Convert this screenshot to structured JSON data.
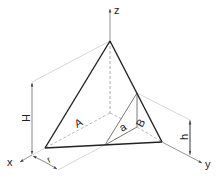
{
  "diagram": {
    "type": "isometric tetrahedron with dimensions",
    "axes": {
      "x": "x",
      "y": "y",
      "z": "z"
    },
    "labels": {
      "face_A": "A",
      "face_B": "B",
      "edge_a": "a",
      "height_H": "H",
      "height_h": "h",
      "offset_r": "r"
    },
    "colors": {
      "stroke": "#222222",
      "thin": "#555555",
      "construction": "#bbbbbb"
    }
  }
}
